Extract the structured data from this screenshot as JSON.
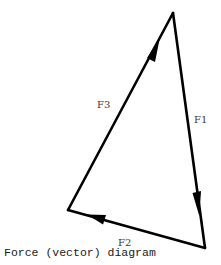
{
  "diagram": {
    "caption": "Force (vector) diagram",
    "stroke_color": "#000000",
    "vertices": {
      "top": [
        173,
        13
      ],
      "bottom_right": [
        205,
        248
      ],
      "bottom_left": [
        68,
        210
      ]
    },
    "vectors": [
      {
        "id": "F1",
        "label": "F1",
        "from": "top",
        "to": "bottom_right",
        "direction": "down"
      },
      {
        "id": "F2",
        "label": "F2",
        "from": "bottom_right",
        "to": "bottom_left",
        "direction": "left"
      },
      {
        "id": "F3",
        "label": "F3",
        "from": "bottom_left",
        "to": "top",
        "direction": "up"
      }
    ]
  }
}
